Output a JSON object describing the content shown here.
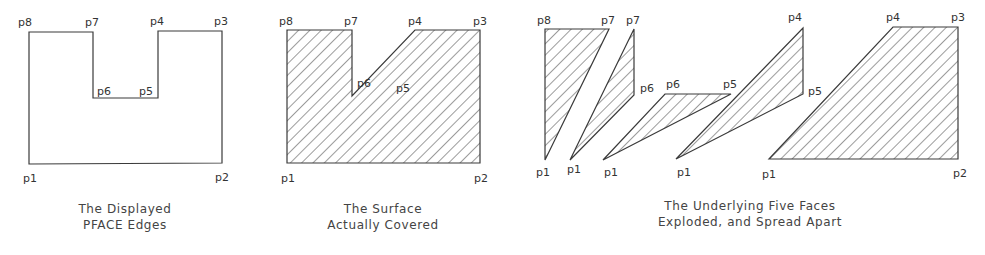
{
  "figures": [
    {
      "id": "displayed-edges",
      "caption": [
        "The Displayed",
        "PFACE Edges"
      ],
      "labels": {
        "p1": "p1",
        "p2": "p2",
        "p3": "p3",
        "p4": "p4",
        "p5": "p5",
        "p6": "p6",
        "p7": "p7",
        "p8": "p8"
      }
    },
    {
      "id": "surface-covered",
      "caption": [
        "The Surface",
        "Actually Covered"
      ],
      "labels": {
        "p1": "p1",
        "p2": "p2",
        "p3": "p3",
        "p4": "p4",
        "p5": "p5",
        "p6": "p6",
        "p7": "p7",
        "p8": "p8"
      }
    },
    {
      "id": "exploded-faces",
      "caption": [
        "The Underlying Five Faces",
        "Exploded, and Spread Apart"
      ],
      "faces": [
        {
          "labels": [
            "p8",
            "p7",
            "p1"
          ]
        },
        {
          "labels": [
            "p7",
            "p6",
            "p1"
          ]
        },
        {
          "labels": [
            "p6",
            "p5",
            "p1"
          ]
        },
        {
          "labels": [
            "p4",
            "p5",
            "p1"
          ]
        },
        {
          "labels": [
            "p4",
            "p3",
            "p2",
            "p1"
          ]
        }
      ]
    }
  ],
  "colors": {
    "stroke": "#3a3a3a",
    "text": "#333333",
    "background": "#ffffff"
  }
}
